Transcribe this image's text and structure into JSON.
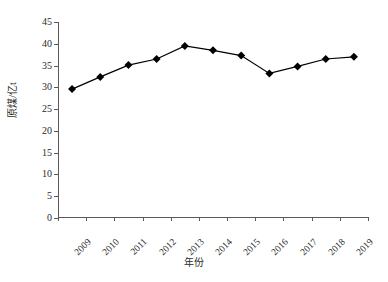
{
  "chart_data": {
    "type": "line",
    "title": "",
    "xlabel": "年份",
    "ylabel": "原煤/亿t",
    "categories": [
      "2009",
      "2010",
      "2011",
      "2012",
      "2013",
      "2014",
      "2015",
      "2016",
      "2017",
      "2018",
      "2019"
    ],
    "values": [
      29.6,
      32.4,
      35.1,
      36.5,
      39.5,
      38.5,
      37.3,
      33.2,
      34.8,
      36.5,
      37.0
    ],
    "series": [
      {
        "name": "原煤产量",
        "values": [
          29.6,
          32.4,
          35.1,
          36.5,
          39.5,
          38.5,
          37.3,
          33.2,
          34.8,
          36.5,
          37.0
        ]
      }
    ],
    "ylim": [
      0,
      45
    ],
    "yticks": [
      0,
      5,
      10,
      15,
      20,
      25,
      30,
      35,
      40,
      45
    ],
    "ytick_labels": [
      "0",
      "5",
      "10",
      "15",
      "20",
      "25",
      "30",
      "35",
      "40",
      "45"
    ],
    "grid": false,
    "legend": "none",
    "marker": "diamond",
    "marker_color": "#000000",
    "line_color": "#000000",
    "axis_color": "#5a5a5a",
    "background": "#ffffff"
  }
}
